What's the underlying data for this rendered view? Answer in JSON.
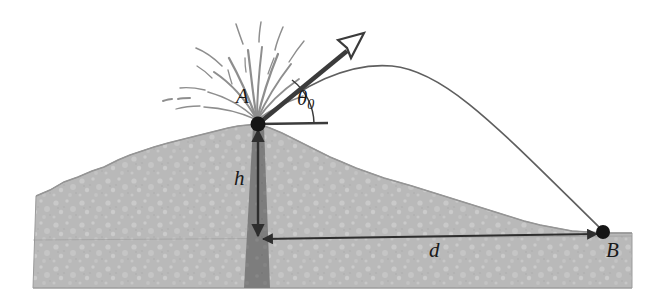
{
  "figure": {
    "background_color": "#ffffff"
  },
  "labels": {
    "point_a": "A",
    "point_b": "B",
    "height": "h",
    "distance": "d",
    "angle_symbol": "θ",
    "angle_subscript": "0"
  },
  "colors": {
    "ground_fill": "#b9b9b9",
    "ground_texture_light": "#d2d2d2",
    "ground_outline": "#8f8f8f",
    "conduit_fill": "#7d7d7d",
    "trajectory_stroke": "#5c5c5c",
    "arrow_stroke": "#3b3b3b",
    "label_color": "#1a1a1a",
    "spray_stroke": "#9a9a9a",
    "arrowhead_fill": "#ffffff"
  },
  "geometry": {
    "point_a": {
      "x": 258,
      "y": 124
    },
    "point_b": {
      "x": 603,
      "y": 232
    },
    "trajectory_apex": {
      "x": 392,
      "y": 66
    },
    "velocity_arrow_tip": {
      "x": 356,
      "y": 41
    },
    "horizontal_reference_end": {
      "x": 328,
      "y": 124
    },
    "height_arrow_bottom": {
      "x": 258,
      "y": 240
    },
    "distance_arrow_left": {
      "x": 258,
      "y": 240
    },
    "distance_arrow_right": {
      "x": 600,
      "y": 234
    },
    "ground_baseline_y": 288,
    "ground_left_x": 33,
    "ground_right_x": 632
  },
  "elements": {
    "ground_name": "volcano-ground",
    "conduit_name": "magma-conduit",
    "trajectory_name": "projectile-trajectory",
    "velocity_arrow_name": "initial-velocity-arrow",
    "spray_name": "eruption-spray",
    "height_arrow_name": "height-dimension-arrow",
    "distance_arrow_name": "distance-dimension-arrow",
    "angle_arc_name": "launch-angle-arc"
  }
}
